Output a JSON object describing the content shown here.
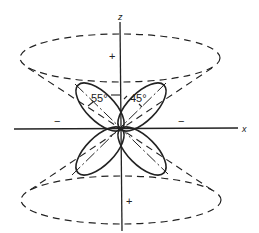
{
  "diagram": {
    "axes": {
      "z_label": "z",
      "x_label": "x"
    },
    "angles": {
      "left": "55°",
      "right": "45°"
    },
    "signs": {
      "top_cone": "+",
      "bottom_cone": "+",
      "left_region": "−",
      "right_region": "−"
    },
    "colors": {
      "line": "#222222",
      "background": "#ffffff"
    }
  }
}
